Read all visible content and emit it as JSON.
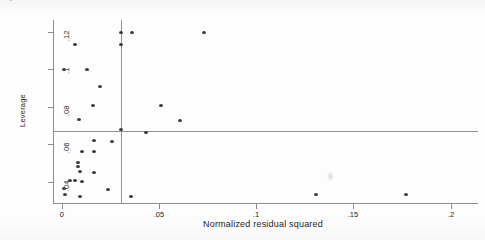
{
  "figure": {
    "background_color": "#fdfdfd",
    "marker_color": "#3a3a3a",
    "axis_color": "#8d8d8d",
    "reference_line_color": "#8f8f8f",
    "scan_artifact_glyph": "e"
  },
  "chart_data": {
    "type": "scatter",
    "title": "",
    "subtitle": "",
    "xlabel": "Normalized residual squared",
    "ylabel": "Leverage",
    "xlim": [
      -0.0045,
      0.211
    ],
    "ylim": [
      0.0285,
      0.1265
    ],
    "xticks": [
      0,
      0.05,
      0.1,
      0.15,
      0.2
    ],
    "xtick_labels": [
      "0",
      ".05",
      ".1",
      ".15",
      ".2"
    ],
    "yticks": [
      0.04,
      0.06,
      0.08,
      0.1,
      0.12
    ],
    "ytick_labels": [
      ".04",
      ".06",
      ".08",
      ".1",
      ".12"
    ],
    "grid": false,
    "legend": null,
    "reference_lines": [
      {
        "orientation": "vertical",
        "value": 0.0303,
        "label": "mean normalized residual squared"
      },
      {
        "orientation": "horizontal",
        "value": 0.0671,
        "label": "mean leverage"
      }
    ],
    "points": [
      {
        "x": 0.0303,
        "y": 0.12
      },
      {
        "x": 0.0362,
        "y": 0.12
      },
      {
        "x": 0.0731,
        "y": 0.12
      },
      {
        "x": 0.007,
        "y": 0.1133
      },
      {
        "x": 0.0306,
        "y": 0.1133
      },
      {
        "x": 0.0013,
        "y": 0.1
      },
      {
        "x": 0.013,
        "y": 0.1
      },
      {
        "x": 0.0199,
        "y": 0.091
      },
      {
        "x": 0.016,
        "y": 0.0805
      },
      {
        "x": 0.0512,
        "y": 0.0805
      },
      {
        "x": 0.009,
        "y": 0.073
      },
      {
        "x": 0.0606,
        "y": 0.0725
      },
      {
        "x": 0.0303,
        "y": 0.068
      },
      {
        "x": 0.0432,
        "y": 0.066
      },
      {
        "x": 0.0166,
        "y": 0.062
      },
      {
        "x": 0.026,
        "y": 0.0615
      },
      {
        "x": 0.0105,
        "y": 0.056
      },
      {
        "x": 0.0166,
        "y": 0.056
      },
      {
        "x": 0.0083,
        "y": 0.05
      },
      {
        "x": 0.0085,
        "y": 0.048
      },
      {
        "x": 0.0093,
        "y": 0.0455
      },
      {
        "x": 0.0166,
        "y": 0.045
      },
      {
        "x": 0.0043,
        "y": 0.0405
      },
      {
        "x": 0.007,
        "y": 0.0405
      },
      {
        "x": 0.0104,
        "y": 0.04
      },
      {
        "x": 0.0014,
        "y": 0.036
      },
      {
        "x": 0.0236,
        "y": 0.0355
      },
      {
        "x": 0.0015,
        "y": 0.033
      },
      {
        "x": 0.0095,
        "y": 0.032
      },
      {
        "x": 0.0356,
        "y": 0.032
      },
      {
        "x": 0.131,
        "y": 0.033
      },
      {
        "x": 0.177,
        "y": 0.033
      }
    ]
  }
}
